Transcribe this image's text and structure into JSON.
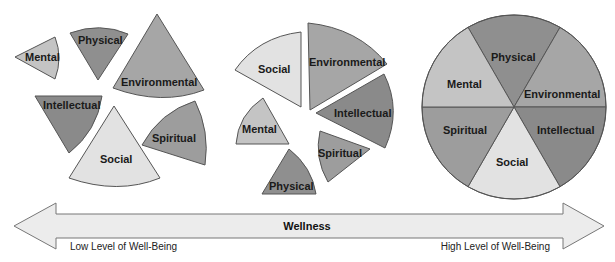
{
  "diagram": {
    "type": "wellness-continuum",
    "stages": [
      {
        "name": "low-wellness-scattered",
        "segments": [
          {
            "label": "Mental",
            "shade": "#c4c4c4"
          },
          {
            "label": "Physical",
            "shade": "#8f8f8f"
          },
          {
            "label": "Environmental",
            "shade": "#a6a6a6"
          },
          {
            "label": "Intellectual",
            "shade": "#8a8a8a"
          },
          {
            "label": "Social",
            "shade": "#e2e2e2"
          },
          {
            "label": "Spiritual",
            "shade": "#9d9d9d"
          }
        ]
      },
      {
        "name": "mid-wellness-partial",
        "segments": [
          {
            "label": "Social",
            "shade": "#e2e2e2"
          },
          {
            "label": "Environmental",
            "shade": "#a6a6a6"
          },
          {
            "label": "Intellectual",
            "shade": "#8a8a8a"
          },
          {
            "label": "Mental",
            "shade": "#c4c4c4"
          },
          {
            "label": "Spiritual",
            "shade": "#9d9d9d"
          },
          {
            "label": "Physical",
            "shade": "#8f8f8f"
          }
        ]
      },
      {
        "name": "high-wellness-integrated",
        "segments": [
          {
            "label": "Physical",
            "shade": "#8f8f8f"
          },
          {
            "label": "Mental",
            "shade": "#c4c4c4"
          },
          {
            "label": "Environmental",
            "shade": "#a6a6a6"
          },
          {
            "label": "Spiritual",
            "shade": "#9d9d9d"
          },
          {
            "label": "Intellectual",
            "shade": "#8a8a8a"
          },
          {
            "label": "Social",
            "shade": "#e2e2e2"
          }
        ]
      }
    ],
    "arrow": {
      "title": "Wellness",
      "left_label": "Low Level of Well-Being",
      "right_label": "High Level of Well-Being",
      "fill": "#ececec",
      "stroke": "#777777"
    }
  }
}
